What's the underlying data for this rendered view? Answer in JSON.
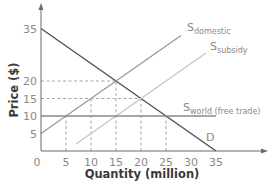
{
  "chart_data": {
    "type": "line",
    "title": "",
    "xlabel": "Quantity (million)",
    "ylabel": "Price ($)",
    "xlim": [
      0,
      35
    ],
    "ylim": [
      0,
      35
    ],
    "x_ticks": [
      0,
      5,
      10,
      15,
      20,
      25,
      30,
      35
    ],
    "y_ticks": [
      5,
      10,
      15,
      20,
      35
    ],
    "grid": false,
    "series": [
      {
        "name": "D",
        "label_main": "D",
        "label_sub": "",
        "color": "#555555",
        "points": [
          [
            0,
            35
          ],
          [
            35,
            0
          ]
        ]
      },
      {
        "name": "S domestic",
        "label_main": "S",
        "label_sub": "domestic",
        "color": "#9a9a9a",
        "points": [
          [
            0,
            5
          ],
          [
            28,
            33
          ]
        ]
      },
      {
        "name": "S subsidy",
        "label_main": "S",
        "label_sub": "subsidy",
        "color": "#c4c4c4",
        "points": [
          [
            7,
            2
          ],
          [
            33,
            28
          ]
        ]
      },
      {
        "name": "S world (free trade)",
        "label_main": "S",
        "label_sub": "world (free trade)",
        "color": "#8a8a8a",
        "points": [
          [
            0,
            10
          ],
          [
            35,
            10
          ]
        ]
      }
    ],
    "reference_lines": [
      {
        "type": "horizontal",
        "y": 20,
        "x_end": 15
      },
      {
        "type": "horizontal",
        "y": 15,
        "x_end": 20
      },
      {
        "type": "vertical",
        "x": 5,
        "y_end": 10
      },
      {
        "type": "vertical",
        "x": 10,
        "y_end": 15
      },
      {
        "type": "vertical",
        "x": 15,
        "y_end": 20
      },
      {
        "type": "vertical",
        "x": 20,
        "y_end": 15
      },
      {
        "type": "vertical",
        "x": 25,
        "y_end": 10
      }
    ],
    "origin_label": "0"
  }
}
